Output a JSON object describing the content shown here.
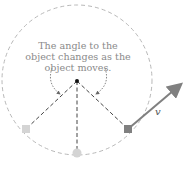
{
  "diagram": {
    "caption": "The angle to the object changes as the object moves.",
    "caption_lines": [
      "The angle to the object",
      "changes as the object",
      "moves."
    ],
    "velocity_label": "v",
    "colors": {
      "circle": "#b8b8b8",
      "lines": "#444444",
      "object_current": "#808080",
      "object_past": "#d4d4d4",
      "arrow": "#808080",
      "caption": "#8a8a8a"
    },
    "elements": {
      "center_point": {
        "x": 77,
        "y": 81
      },
      "orbit_radius": 75,
      "objects": [
        {
          "name": "past-object-left",
          "x": 26,
          "y": 129
        },
        {
          "name": "past-object-bottom",
          "x": 77,
          "y": 153
        },
        {
          "name": "current-object-right",
          "x": 128,
          "y": 129
        }
      ]
    }
  }
}
